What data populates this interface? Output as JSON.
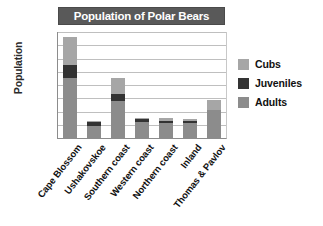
{
  "chart_data": {
    "type": "bar",
    "subtype": "stacked-vertical",
    "title": "Population of Polar Bears",
    "xlabel": "",
    "ylabel": "Population",
    "ylim": [
      0,
      80
    ],
    "ytick_step": 10,
    "yticks": [
      "80",
      "70",
      "60",
      "50",
      "40",
      "30",
      "20",
      "10",
      "0"
    ],
    "grid": true,
    "legend_position": "right",
    "categories": [
      "Cape Blossom",
      "Ushakovskoe",
      "Southern coast",
      "Western coast",
      "Northern coast",
      "Inland",
      "Thomas & Pavlov"
    ],
    "series": [
      {
        "name": "Adults",
        "color": "#8c8c8c",
        "values": [
          45,
          9,
          28,
          12,
          11,
          11,
          21
        ]
      },
      {
        "name": "Juveniles",
        "color": "#333333",
        "values": [
          10,
          3,
          5,
          2,
          2,
          2,
          0
        ]
      },
      {
        "name": "Cubs",
        "color": "#a6a6a6",
        "values": [
          21,
          1,
          12,
          1,
          2,
          1,
          8
        ]
      }
    ],
    "totals": [
      76,
      13,
      45,
      15,
      15,
      14,
      29
    ],
    "stack_order_bottom_to_top": [
      "Adults",
      "Juveniles",
      "Cubs"
    ]
  },
  "legend": {
    "items": [
      {
        "label": "Cubs",
        "color": "#a6a6a6"
      },
      {
        "label": "Juveniles",
        "color": "#333333"
      },
      {
        "label": "Adults",
        "color": "#8c8c8c"
      }
    ]
  },
  "colors": {
    "title_banner_bg": "#595959",
    "title_text": "#ffffff",
    "gridline": "#bfbfbf",
    "axis": "#8c8c8c",
    "plot_bg": "#ffffff"
  }
}
